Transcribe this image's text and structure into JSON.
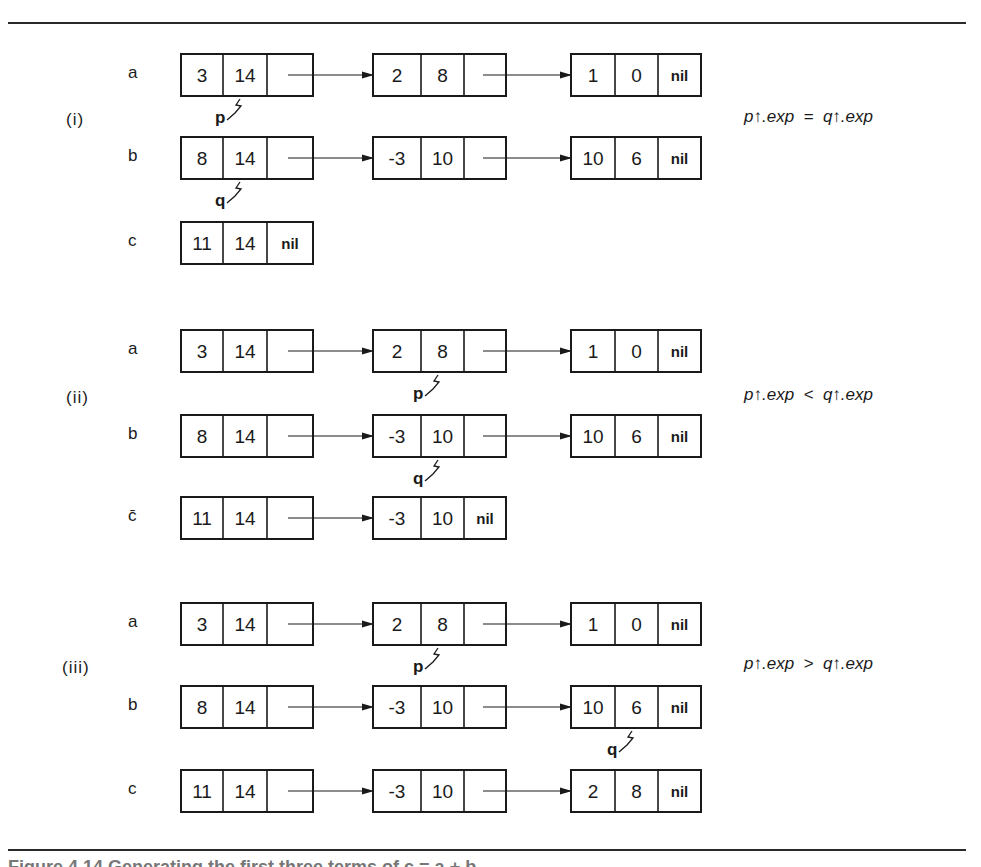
{
  "figure": {
    "caption_partial": "Figure 4.14 Generating the first three terms of c = a + b",
    "colors": {
      "ink": "#1a1a1a",
      "rule": "#2a2a2a",
      "background": "#ffffff"
    },
    "layout": {
      "node_columns": [
        {
          "x": 181,
          "cells": [
            42,
            44,
            46
          ]
        },
        {
          "x": 373,
          "cells": [
            48,
            43,
            42
          ]
        },
        {
          "x": 571,
          "cells": [
            44,
            43,
            43
          ]
        }
      ],
      "node_height": 42
    },
    "sections": [
      {
        "label": "(i)",
        "label_pos": [
          66,
          121
        ],
        "condition": "p↑.exp  =  q↑.exp",
        "condition_pos": [
          744,
          118
        ],
        "rows": [
          {
            "name": "a",
            "y": 54,
            "nodes": [
              [
                "3",
                "14",
                ""
              ],
              [
                "2",
                "8",
                ""
              ],
              [
                "1",
                "0",
                "nil"
              ]
            ]
          },
          {
            "name": "b",
            "y": 137,
            "nodes": [
              [
                "8",
                "14",
                ""
              ],
              [
                "-3",
                "10",
                ""
              ],
              [
                "10",
                "6",
                "nil"
              ]
            ]
          },
          {
            "name": "c",
            "y": 222,
            "nodes": [
              [
                "11",
                "14",
                "nil"
              ]
            ]
          }
        ],
        "pointers": [
          {
            "name": "p",
            "row": 0,
            "node": 0,
            "cell": 1
          },
          {
            "name": "q",
            "row": 1,
            "node": 0,
            "cell": 1
          }
        ]
      },
      {
        "label": "(ii)",
        "label_pos": [
          66,
          399
        ],
        "condition": "p↑.exp  <  q↑.exp",
        "condition_pos": [
          744,
          396
        ],
        "rows": [
          {
            "name": "a",
            "y": 330,
            "nodes": [
              [
                "3",
                "14",
                ""
              ],
              [
                "2",
                "8",
                ""
              ],
              [
                "1",
                "0",
                "nil"
              ]
            ]
          },
          {
            "name": "b",
            "y": 415,
            "nodes": [
              [
                "8",
                "14",
                ""
              ],
              [
                "-3",
                "10",
                ""
              ],
              [
                "10",
                "6",
                "nil"
              ]
            ]
          },
          {
            "name": "c̄",
            "y": 497,
            "nodes": [
              [
                "11",
                "14",
                ""
              ],
              [
                "-3",
                "10",
                "nil"
              ]
            ]
          }
        ],
        "pointers": [
          {
            "name": "p",
            "row": 0,
            "node": 1,
            "cell": 1
          },
          {
            "name": "q",
            "row": 1,
            "node": 1,
            "cell": 1
          }
        ]
      },
      {
        "label": "(iii)",
        "label_pos": [
          62,
          669
        ],
        "condition": "p↑.exp  >  q↑.exp",
        "condition_pos": [
          744,
          665
        ],
        "rows": [
          {
            "name": "a",
            "y": 603,
            "nodes": [
              [
                "3",
                "14",
                ""
              ],
              [
                "2",
                "8",
                ""
              ],
              [
                "1",
                "0",
                "nil"
              ]
            ]
          },
          {
            "name": "b",
            "y": 686,
            "nodes": [
              [
                "8",
                "14",
                ""
              ],
              [
                "-3",
                "10",
                ""
              ],
              [
                "10",
                "6",
                "nil"
              ]
            ]
          },
          {
            "name": "c",
            "y": 770,
            "nodes": [
              [
                "11",
                "14",
                ""
              ],
              [
                "-3",
                "10",
                ""
              ],
              [
                "2",
                "8",
                "nil"
              ]
            ]
          }
        ],
        "pointers": [
          {
            "name": "p",
            "row": 0,
            "node": 1,
            "cell": 1
          },
          {
            "name": "q",
            "row": 1,
            "node": 2,
            "cell": 1
          }
        ]
      }
    ],
    "row_label_x": 128,
    "rules_y": [
      22,
      849
    ]
  }
}
